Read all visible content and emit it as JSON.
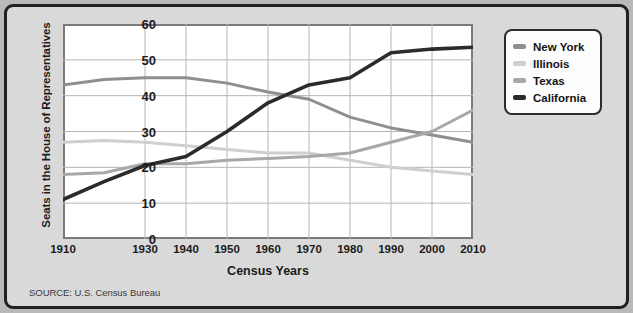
{
  "chart_data": {
    "type": "line",
    "title": "",
    "xlabel": "Census Years",
    "ylabel": "Seats in the House of Representatives",
    "source": "SOURCE: U.S. Census Bureau",
    "x": [
      1910,
      1920,
      1930,
      1940,
      1950,
      1960,
      1970,
      1980,
      1990,
      2000,
      2010
    ],
    "xtick_labels": [
      "1910",
      "1930",
      "1940",
      "1950",
      "1960",
      "1970",
      "1980",
      "1990",
      "2000",
      "2010"
    ],
    "xtick_values": [
      1910,
      1930,
      1940,
      1950,
      1960,
      1970,
      1980,
      1990,
      2000,
      2010
    ],
    "ytick_labels": [
      "0",
      "10",
      "20",
      "30",
      "40",
      "50",
      "60"
    ],
    "ytick_values": [
      0,
      10,
      20,
      30,
      40,
      50,
      60
    ],
    "xlim": [
      1910,
      2010
    ],
    "ylim": [
      0,
      60
    ],
    "grid": true,
    "legend_position": "outside-right-top",
    "series": [
      {
        "name": "New York",
        "color": "#8f8f8f",
        "values": [
          43,
          44.5,
          45,
          45,
          43.5,
          41,
          39,
          34,
          31,
          29,
          27
        ]
      },
      {
        "name": "Illinois",
        "color": "#cfcfcf",
        "values": [
          27,
          27.5,
          27,
          26,
          25,
          24,
          24,
          22,
          20,
          19,
          18
        ]
      },
      {
        "name": "Texas",
        "color": "#a8a8a8",
        "values": [
          18,
          18.5,
          21,
          21,
          22,
          22.5,
          23,
          24,
          27,
          30,
          36
        ]
      },
      {
        "name": "California",
        "color": "#2b2b2b",
        "values": [
          11,
          16,
          20.5,
          23,
          30,
          38,
          43,
          45,
          52,
          53,
          53.5
        ]
      }
    ]
  }
}
